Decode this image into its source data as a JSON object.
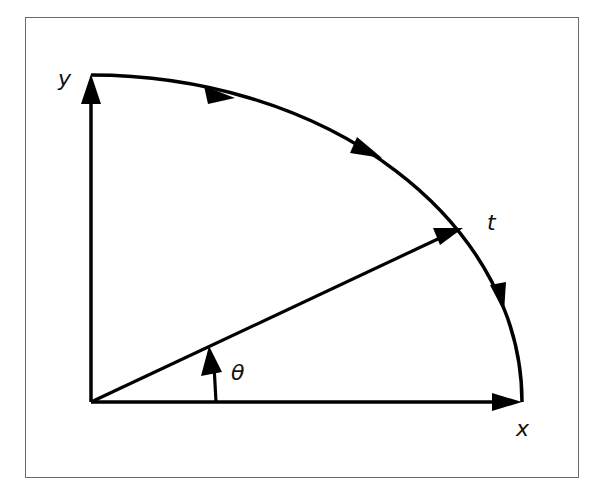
{
  "diagram": {
    "labels": {
      "y_axis": "y",
      "x_axis": "x",
      "angle": "θ",
      "point": "t"
    },
    "colors": {
      "stroke": "#000000",
      "frame": "#6b6b6b",
      "background": "#ffffff"
    },
    "elements": [
      "y-axis with arrow",
      "x-axis with arrow",
      "radius vector to point t",
      "angle theta arc arrow",
      "quarter-ellipse curve with three direction arrows"
    ]
  }
}
